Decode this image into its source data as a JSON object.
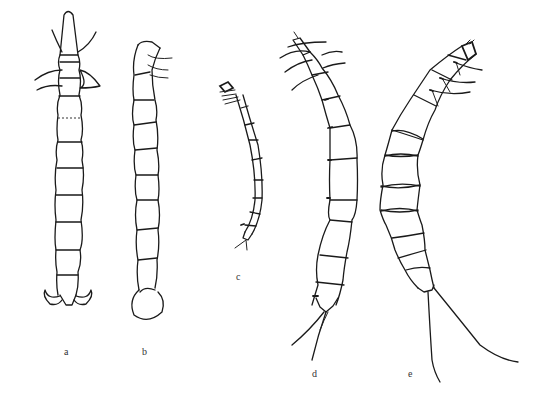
{
  "figure": {
    "panels": [
      {
        "id": "a",
        "label": "a"
      },
      {
        "id": "b",
        "label": "b"
      },
      {
        "id": "c",
        "label": "c"
      },
      {
        "id": "d",
        "label": "d"
      },
      {
        "id": "e",
        "label": "e"
      }
    ]
  }
}
